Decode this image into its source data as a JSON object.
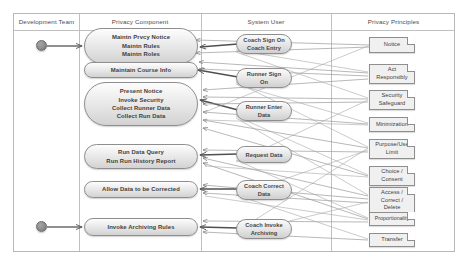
{
  "diagram": {
    "lanes": [
      {
        "id": "development-team",
        "label": "Development Team"
      },
      {
        "id": "privacy-component",
        "label": "Privacy Component"
      },
      {
        "id": "system-user",
        "label": "System User"
      },
      {
        "id": "privacy-principles",
        "label": "Privacy Principles"
      }
    ],
    "colors": {
      "frame_border": "#b8b8b8",
      "node_border": "#8e8e8e",
      "node_fill_light": "#fdfdfd",
      "node_fill_dark": "#d2d2d2",
      "note_fill": "#f0f0f0",
      "actor_fill": "#8d8d8d",
      "connector": "#9a9a9a",
      "connector_bold": "#5a5a5a",
      "text": "#3d3d3d"
    },
    "actors": [
      {
        "id": "actor-top",
        "name": "development-team-actor-top"
      },
      {
        "id": "actor-bottom",
        "name": "development-team-actor-bottom"
      }
    ],
    "activities": [
      {
        "id": "maintain-privacy",
        "lines": [
          "Maintn Prvcy Notice",
          "Maintn Rules",
          "Maintn Roles"
        ]
      },
      {
        "id": "maintain-course-info",
        "lines": [
          "Maintain Course Info"
        ]
      },
      {
        "id": "present-notice",
        "lines": [
          "Present Notice",
          "Invoke Security",
          "Collect  Runner Data",
          "Collect Run Data"
        ]
      },
      {
        "id": "run-data-query",
        "lines": [
          "Run Data Query",
          "Run Run History Report"
        ]
      },
      {
        "id": "allow-correction",
        "lines": [
          "Allow Data to be Corrected"
        ]
      },
      {
        "id": "invoke-archiving",
        "lines": [
          "Invoke Archiving Rules"
        ]
      }
    ],
    "user_actions": [
      {
        "id": "coach-sign-on",
        "lines": [
          "Coach Sign On",
          "Coach Entry"
        ]
      },
      {
        "id": "runner-sign-on",
        "lines": [
          "Runner Sign",
          "On"
        ]
      },
      {
        "id": "runner-enter-data",
        "lines": [
          "Runner Enter",
          "Data"
        ]
      },
      {
        "id": "request-data",
        "lines": [
          "Request Data"
        ]
      },
      {
        "id": "coach-correct-data",
        "lines": [
          "Coach Correct",
          "Data"
        ]
      },
      {
        "id": "coach-invoke-archiving",
        "lines": [
          "Coach Invoke",
          "Archiving"
        ]
      }
    ],
    "principles": [
      {
        "id": "notice",
        "lines": [
          "Notice"
        ]
      },
      {
        "id": "act-responsibly",
        "lines": [
          "Act",
          "Responsibly"
        ]
      },
      {
        "id": "security-safeguard",
        "lines": [
          "Security",
          "Safeguard"
        ]
      },
      {
        "id": "minimization",
        "lines": [
          "Minimization"
        ]
      },
      {
        "id": "purpose-use-limit",
        "lines": [
          "Purpose/Use",
          "Limit"
        ]
      },
      {
        "id": "choice-consent",
        "lines": [
          "Choice /",
          "Consent"
        ]
      },
      {
        "id": "access-correct-delete",
        "lines": [
          "Access /",
          "Correct /",
          "Delete"
        ]
      },
      {
        "id": "proportionality",
        "lines": [
          "Proportionality"
        ]
      },
      {
        "id": "transfer",
        "lines": [
          "Transfer"
        ]
      }
    ]
  }
}
